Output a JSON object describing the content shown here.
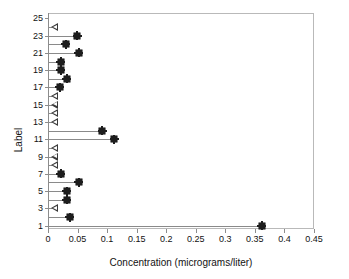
{
  "chart_data": {
    "type": "bar",
    "orientation": "horizontal",
    "title": "",
    "xlabel": "Concentration (micrograms/liter)",
    "ylabel": "Label",
    "xlim": [
      0,
      0.45
    ],
    "xticks": [
      0,
      0.05,
      0.1,
      0.15,
      0.2,
      0.25,
      0.3,
      0.35,
      0.4,
      0.45
    ],
    "xtick_labels": [
      "0",
      "0.05",
      "0.1",
      "0.15",
      "0.2",
      "0.25",
      "0.3",
      "0.35",
      "0.4",
      "0.45"
    ],
    "ylim": [
      0.5,
      25.5
    ],
    "yticks": [
      1,
      3,
      5,
      7,
      9,
      11,
      13,
      15,
      17,
      19,
      21,
      23,
      25
    ],
    "ytick_labels": [
      "1",
      "3",
      "5",
      "7",
      "9",
      "11",
      "13",
      "15",
      "17",
      "19",
      "21",
      "23",
      "25"
    ],
    "grid": false,
    "legend": "none",
    "marker_types": {
      "detected": "filled-square-star",
      "non_detect": "open-left-triangle"
    },
    "categories": [
      1,
      2,
      3,
      4,
      5,
      6,
      7,
      8,
      9,
      10,
      11,
      12,
      13,
      14,
      15,
      16,
      17,
      18,
      19,
      20,
      21,
      22,
      23,
      24,
      25
    ],
    "values": [
      0.36,
      0.035,
      0.005,
      0.03,
      0.03,
      0.05,
      0.02,
      0.005,
      0.005,
      0.005,
      0.11,
      0.09,
      0.005,
      0.005,
      0.005,
      0.005,
      0.018,
      0.03,
      0.02,
      0.02,
      0.05,
      0.028,
      0.048,
      0.005,
      0.0
    ],
    "points": [
      {
        "label": 25,
        "value": 0.0,
        "marker": "none"
      },
      {
        "label": 24,
        "value": 0.005,
        "marker": "non_detect"
      },
      {
        "label": 23,
        "value": 0.048,
        "marker": "detected"
      },
      {
        "label": 22,
        "value": 0.028,
        "marker": "detected"
      },
      {
        "label": 21,
        "value": 0.05,
        "marker": "detected"
      },
      {
        "label": 20,
        "value": 0.02,
        "marker": "detected"
      },
      {
        "label": 19,
        "value": 0.02,
        "marker": "detected"
      },
      {
        "label": 18,
        "value": 0.03,
        "marker": "detected"
      },
      {
        "label": 17,
        "value": 0.018,
        "marker": "detected"
      },
      {
        "label": 16,
        "value": 0.005,
        "marker": "non_detect"
      },
      {
        "label": 15,
        "value": 0.005,
        "marker": "non_detect"
      },
      {
        "label": 14,
        "value": 0.005,
        "marker": "non_detect"
      },
      {
        "label": 13,
        "value": 0.005,
        "marker": "non_detect"
      },
      {
        "label": 12,
        "value": 0.09,
        "marker": "detected"
      },
      {
        "label": 11,
        "value": 0.11,
        "marker": "detected"
      },
      {
        "label": 10,
        "value": 0.005,
        "marker": "non_detect"
      },
      {
        "label": 9,
        "value": 0.005,
        "marker": "non_detect"
      },
      {
        "label": 8,
        "value": 0.005,
        "marker": "non_detect"
      },
      {
        "label": 7,
        "value": 0.02,
        "marker": "detected"
      },
      {
        "label": 6,
        "value": 0.05,
        "marker": "detected"
      },
      {
        "label": 5,
        "value": 0.03,
        "marker": "detected"
      },
      {
        "label": 4,
        "value": 0.03,
        "marker": "detected"
      },
      {
        "label": 3,
        "value": 0.005,
        "marker": "non_detect"
      },
      {
        "label": 2,
        "value": 0.035,
        "marker": "detected"
      },
      {
        "label": 1,
        "value": 0.36,
        "marker": "detected"
      }
    ]
  },
  "colors": {
    "frame": "#b9b9b9",
    "axis": "#8c8c8c",
    "bar": "#8a8a8a",
    "marker": "#1d1d1d",
    "text": "#121212",
    "background": "#ffffff"
  }
}
